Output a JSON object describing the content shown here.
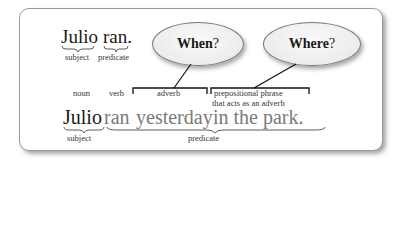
{
  "top_sentence": {
    "subject_word": "Julio",
    "predicate_word": "ran.",
    "subject_label": "subject",
    "predicate_label": "predicate"
  },
  "bubbles": [
    {
      "word": "When",
      "mark": "?"
    },
    {
      "word": "Where",
      "mark": "?"
    }
  ],
  "pos_labels": {
    "noun": "noun",
    "verb": "verb",
    "adverb": "adverb",
    "prep_line1": "prepositional phrase",
    "prep_line2": "that acts as an adverb"
  },
  "bottom_sentence": {
    "subject_word": "Julio",
    "verb_word": "ran",
    "adverb_word": "yesterday",
    "prep_phrase": "in the park.",
    "subject_label": "subject",
    "predicate_label": "predicate"
  },
  "colors": {
    "text_dark": "#1a1a1a",
    "text_grey": "#7a7a7a",
    "border": "#9a9a9a"
  }
}
